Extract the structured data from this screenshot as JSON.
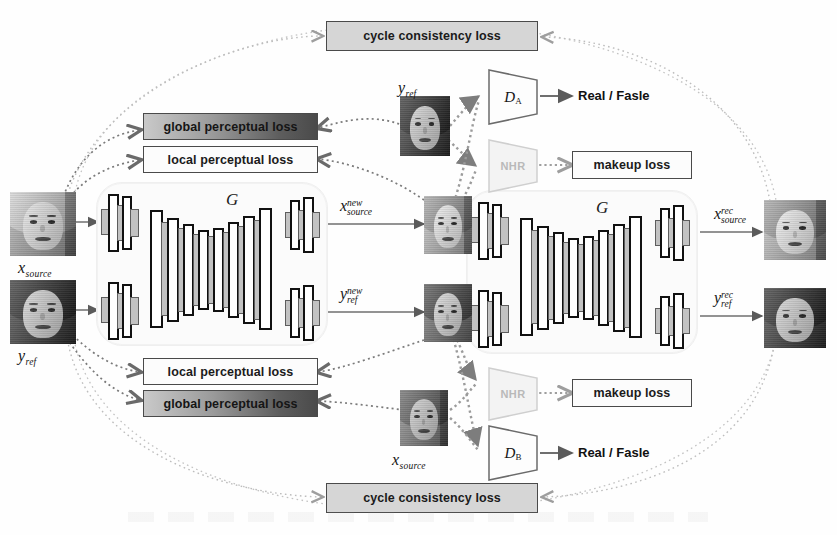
{
  "figure": {
    "type": "diagram"
  },
  "losses": {
    "cycle_top": "cycle consistency loss",
    "cycle_bottom": "cycle consistency loss",
    "global_top": "global perceptual loss",
    "local_top": "local perceptual loss",
    "local_bottom": "local perceptual loss",
    "global_bottom": "global perceptual loss",
    "makeup_top": "makeup loss",
    "makeup_bottom": "makeup loss"
  },
  "generators": {
    "left_label": "G",
    "right_label": "G"
  },
  "discriminators": {
    "a": {
      "base": "D",
      "sub": "A",
      "output": "Real / Fasle"
    },
    "b": {
      "base": "D",
      "sub": "B",
      "output": "Real / Fasle"
    }
  },
  "nhr": {
    "top": "NHR",
    "bottom": "NHR"
  },
  "variables": {
    "x_source_left": {
      "base": "x",
      "sub": "source",
      "sup": ""
    },
    "y_ref_left": {
      "base": "y",
      "sub": "ref",
      "sup": ""
    },
    "x_source_new": {
      "base": "x",
      "sub": "source",
      "sup": "new"
    },
    "y_ref_new": {
      "base": "y",
      "sub": "ref",
      "sup": "new"
    },
    "x_source_rec": {
      "base": "x",
      "sub": "source",
      "sup": "rec"
    },
    "y_ref_rec": {
      "base": "y",
      "sub": "ref",
      "sup": "rec"
    },
    "y_ref_top": {
      "base": "y",
      "sub": "ref",
      "sup": ""
    },
    "x_source_bottom": {
      "base": "x",
      "sub": "source",
      "sup": ""
    }
  },
  "colors": {
    "loss_fill_grey": "#d8d8d8",
    "loss_fill_white": "#fcfcfc",
    "loss_border": "#4a4a4a",
    "gradient_dark": "#4a4a4a",
    "slab_stroke": "#111111",
    "slab_shadow": "#c2c2c2",
    "nhr_text": "#b9b9b9",
    "wire": "#6f6f6f"
  }
}
